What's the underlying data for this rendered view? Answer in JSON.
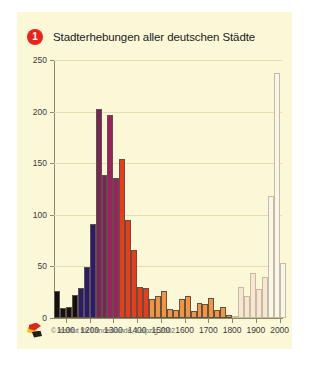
{
  "figure": {
    "background_color": "#fbf8d8",
    "badge_number": "1",
    "badge_color": "#e8241c",
    "title": "Stadterhebungen aller deutschen Städte",
    "copyright": "© Institut für Länderkunde, Leipzig 2002",
    "logo_name": "institut-fuer-laenderkunde-logo"
  },
  "chart_data": {
    "type": "bar",
    "title": "Stadterhebungen aller deutschen Städte",
    "xlabel": "",
    "ylabel": "",
    "xlim": [
      1050,
      2010
    ],
    "ylim": [
      0,
      250
    ],
    "grid": true,
    "legend": "none",
    "bin_width": 25,
    "xticks": [
      1100,
      1200,
      1300,
      1400,
      1500,
      1600,
      1700,
      1800,
      1900,
      2000
    ],
    "yticks": [
      0,
      50,
      100,
      150,
      200,
      250
    ],
    "xtick_labels": [
      "1100",
      "1200",
      "1300",
      "1400",
      "1500",
      "1600",
      "1700",
      "1800",
      "1900",
      "2000"
    ],
    "ytick_labels": [
      "0",
      "50",
      "100",
      "150",
      "200",
      "250"
    ],
    "palette": {
      "black": "#140f10",
      "navy": "#2a1a70",
      "purple": "#7c2458",
      "magenta": "#9e2060",
      "red": "#ef3a18",
      "orange": "#f5933e",
      "pale": "#f6e6d2",
      "cream": "#f7f7ea",
      "edge_dark": "#5d5248",
      "edge_light": "#c8b9a2"
    },
    "bars": [
      {
        "x": 1050,
        "value": 26,
        "color": "black"
      },
      {
        "x": 1075,
        "value": 10,
        "color": "black"
      },
      {
        "x": 1100,
        "value": 11,
        "color": "black"
      },
      {
        "x": 1125,
        "value": 22,
        "color": "black"
      },
      {
        "x": 1150,
        "value": 29,
        "color": "navy"
      },
      {
        "x": 1175,
        "value": 49,
        "color": "navy"
      },
      {
        "x": 1200,
        "value": 91,
        "color": "navy"
      },
      {
        "x": 1225,
        "value": 203,
        "color": "purple"
      },
      {
        "x": 1250,
        "value": 139,
        "color": "purple"
      },
      {
        "x": 1275,
        "value": 197,
        "color": "magenta"
      },
      {
        "x": 1300,
        "value": 136,
        "color": "magenta"
      },
      {
        "x": 1325,
        "value": 154,
        "color": "red"
      },
      {
        "x": 1350,
        "value": 95,
        "color": "red"
      },
      {
        "x": 1375,
        "value": 66,
        "color": "red"
      },
      {
        "x": 1400,
        "value": 30,
        "color": "red"
      },
      {
        "x": 1425,
        "value": 29,
        "color": "red"
      },
      {
        "x": 1450,
        "value": 18,
        "color": "orange"
      },
      {
        "x": 1475,
        "value": 21,
        "color": "orange"
      },
      {
        "x": 1500,
        "value": 26,
        "color": "orange"
      },
      {
        "x": 1525,
        "value": 9,
        "color": "orange"
      },
      {
        "x": 1550,
        "value": 8,
        "color": "orange"
      },
      {
        "x": 1575,
        "value": 18,
        "color": "orange"
      },
      {
        "x": 1600,
        "value": 21,
        "color": "orange"
      },
      {
        "x": 1625,
        "value": 7,
        "color": "orange"
      },
      {
        "x": 1650,
        "value": 15,
        "color": "orange"
      },
      {
        "x": 1675,
        "value": 14,
        "color": "orange"
      },
      {
        "x": 1700,
        "value": 19,
        "color": "orange"
      },
      {
        "x": 1725,
        "value": 8,
        "color": "orange"
      },
      {
        "x": 1750,
        "value": 11,
        "color": "orange"
      },
      {
        "x": 1775,
        "value": 3,
        "color": "orange"
      },
      {
        "x": 1800,
        "value": 2,
        "color": "pale"
      },
      {
        "x": 1825,
        "value": 30,
        "color": "pale"
      },
      {
        "x": 1850,
        "value": 21,
        "color": "pale"
      },
      {
        "x": 1875,
        "value": 44,
        "color": "pale"
      },
      {
        "x": 1900,
        "value": 28,
        "color": "pale"
      },
      {
        "x": 1925,
        "value": 40,
        "color": "pale"
      },
      {
        "x": 1950,
        "value": 118,
        "color": "cream"
      },
      {
        "x": 1975,
        "value": 237,
        "color": "cream"
      },
      {
        "x": 2000,
        "value": 53,
        "color": "cream"
      }
    ]
  }
}
